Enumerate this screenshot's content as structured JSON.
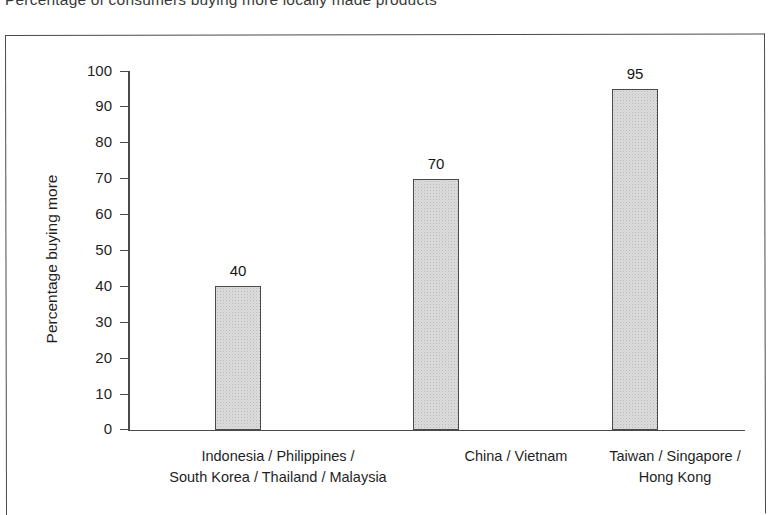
{
  "title": "Percentage of consumers buying more locally made products",
  "chart_data": {
    "type": "bar",
    "title": "Percentage of consumers buying more locally made products",
    "xlabel": "",
    "ylabel": "Percentage buying more",
    "ylim": [
      0,
      100
    ],
    "y_ticks": [
      0,
      10,
      20,
      30,
      40,
      50,
      60,
      70,
      80,
      90,
      100
    ],
    "grid": false,
    "legend": "none",
    "categories": [
      "Indonesia / Philippines / South Korea / Thailand / Malaysia",
      "China / Vietnam",
      "Taiwan / Singapore / Hong Kong"
    ],
    "category_lines": [
      [
        "Indonesia / Philippines /",
        "South Korea / Thailand / Malaysia"
      ],
      [
        "China / Vietnam",
        ""
      ],
      [
        "Taiwan / Singapore /",
        "Hong Kong"
      ]
    ],
    "values": [
      40,
      70,
      95
    ],
    "value_labels": [
      "40",
      "70",
      "95"
    ],
    "bar_fill": "#dcdcdc",
    "bar_edge": "#4a4a4a",
    "axis_color": "#4a4a4a"
  },
  "axis": {
    "tick_labels": [
      "100",
      "90",
      "80",
      "70",
      "60",
      "50",
      "40",
      "30",
      "20",
      "10",
      "0"
    ]
  }
}
